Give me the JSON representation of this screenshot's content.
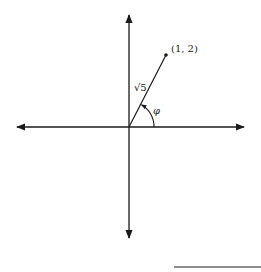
{
  "diagram": {
    "type": "polar-coordinate-vector",
    "point_label": "(1, 2)",
    "magnitude_label": "√5",
    "angle_label": "φ",
    "point": {
      "x": 1,
      "y": 2
    },
    "colors": {
      "stroke": "#1a1a1a",
      "background": "#ffffff"
    }
  },
  "elements": {
    "x_axis": {
      "arrows": [
        "left",
        "right"
      ]
    },
    "y_axis": {
      "arrows": [
        "up",
        "down"
      ]
    },
    "vector": {
      "from": "origin",
      "to": "(1, 2)",
      "length": "√5"
    },
    "angle_arc": {
      "label": "φ",
      "measured_from": "positive x-axis"
    },
    "footnote_rule": {
      "present": true
    }
  }
}
